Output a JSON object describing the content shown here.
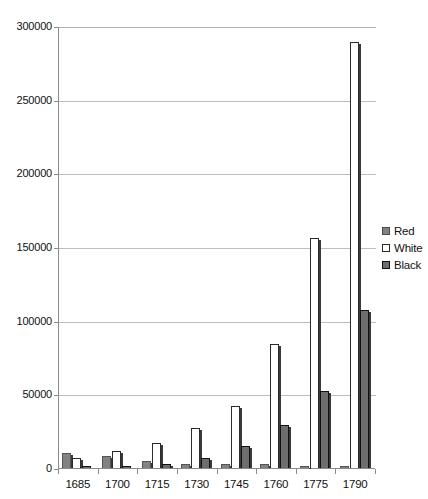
{
  "chart_data": {
    "type": "bar",
    "title": "",
    "subtitle": "",
    "xlabel": "",
    "ylabel": "",
    "categories": [
      "1685",
      "1700",
      "1715",
      "1730",
      "1745",
      "1760",
      "1775",
      "1790"
    ],
    "series": [
      {
        "name": "Red",
        "color": "#828282",
        "values": [
          10000,
          8000,
          4500,
          2500,
          3000,
          2500,
          1500,
          1000
        ]
      },
      {
        "name": "White",
        "color": "#ffffff",
        "values": [
          6500,
          11500,
          17000,
          27000,
          42000,
          84000,
          156000,
          289000
        ]
      },
      {
        "name": "Black",
        "color": "#6e6e6e",
        "values": [
          500,
          1200,
          2500,
          7000,
          15000,
          29000,
          52000,
          107000
        ]
      }
    ],
    "ylim": [
      0,
      300000
    ],
    "yticks": [
      "0",
      "50000",
      "100000",
      "150000",
      "200000",
      "250000",
      "300000"
    ],
    "ytick_values": [
      0,
      50000,
      100000,
      150000,
      200000,
      250000,
      300000
    ],
    "grid": true,
    "legend_position": "right"
  },
  "legend": {
    "items": [
      {
        "label": "Red",
        "swatch": "legend-swatch-red"
      },
      {
        "label": "White",
        "swatch": "legend-swatch-white"
      },
      {
        "label": "Black",
        "swatch": "legend-swatch-black"
      }
    ]
  },
  "colors": {
    "series_red": "#828282",
    "series_white": "#ffffff",
    "series_black": "#6e6e6e",
    "gridline": "#bdbdbd",
    "axis": "#8a8a8a",
    "text": "#111111",
    "background": "#ffffff"
  }
}
